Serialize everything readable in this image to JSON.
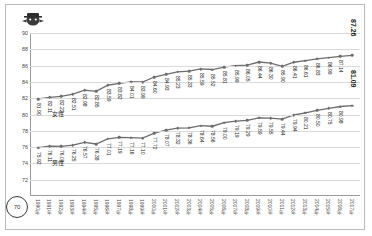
{
  "figure": {
    "logo_icon": "mascot-logo-icon",
    "page_badge": "70",
    "border_color": "#b9b9b9"
  },
  "chart_data": {
    "type": "line",
    "title": "",
    "xlabel": "",
    "ylabel": "",
    "ylim": [
      70,
      90
    ],
    "yticks": [
      72,
      74,
      76,
      78,
      80,
      82,
      84,
      86,
      88,
      90
    ],
    "grid": true,
    "legend_position": "inline-labels",
    "categories": [
      "1990年",
      "1991年",
      "1992年",
      "1993年",
      "1994年",
      "1995年",
      "1996年",
      "1997年",
      "1998年",
      "1999年",
      "2000年",
      "2001年",
      "2002年",
      "2003年",
      "2004年",
      "2005年",
      "2006年",
      "2007年",
      "2008年",
      "2009年",
      "2010年",
      "2011年",
      "2012年",
      "2013年",
      "2014年",
      "2015年",
      "2016年",
      "2017年"
    ],
    "series": [
      {
        "name": "女性",
        "color": "#6d6d6d",
        "values": [
          81.9,
          82.11,
          82.22,
          82.51,
          82.98,
          82.85,
          83.59,
          83.82,
          84.01,
          83.99,
          84.6,
          84.93,
          85.23,
          85.33,
          85.59,
          85.52,
          85.81,
          85.99,
          86.05,
          86.44,
          86.3,
          85.9,
          86.41,
          86.61,
          86.83,
          86.99,
          87.14,
          87.26
        ],
        "end_label": "87.26"
      },
      {
        "name": "男性",
        "color": "#6d6d6d",
        "values": [
          75.92,
          76.11,
          76.09,
          76.25,
          76.57,
          76.38,
          77.01,
          77.19,
          77.16,
          77.1,
          77.72,
          78.07,
          78.32,
          78.36,
          78.64,
          78.56,
          79.0,
          79.19,
          79.29,
          79.59,
          79.55,
          79.44,
          79.94,
          80.21,
          80.5,
          80.75,
          80.98,
          81.09
        ],
        "end_label": "81.09"
      }
    ]
  }
}
